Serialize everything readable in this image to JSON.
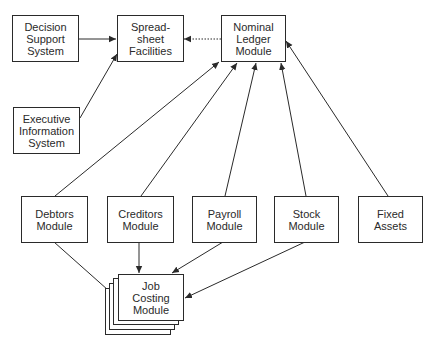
{
  "diagram": {
    "nodes": {
      "decision_support": {
        "label": "Decision\nSupport\nSystem"
      },
      "spreadsheet": {
        "label": "Spread-\nsheet\nFacilities"
      },
      "nominal_ledger": {
        "label": "Nominal\nLedger\nModule"
      },
      "executive_info": {
        "label": "Executive\nInformation\nSystem"
      },
      "debtors": {
        "label": "Debtors\nModule"
      },
      "creditors": {
        "label": "Creditors\nModule"
      },
      "payroll": {
        "label": "Payroll\nModule"
      },
      "stock": {
        "label": "Stock\nModule"
      },
      "fixed_assets": {
        "label": "Fixed\nAssets"
      },
      "job_costing": {
        "label": "Job\nCosting\nModule"
      }
    },
    "edges": [
      {
        "from": "decision_support",
        "to": "spreadsheet",
        "style": "solid"
      },
      {
        "from": "executive_info",
        "to": "spreadsheet",
        "style": "solid"
      },
      {
        "from": "nominal_ledger",
        "to": "spreadsheet",
        "style": "dotted"
      },
      {
        "from": "debtors",
        "to": "nominal_ledger",
        "style": "solid"
      },
      {
        "from": "creditors",
        "to": "nominal_ledger",
        "style": "solid"
      },
      {
        "from": "payroll",
        "to": "nominal_ledger",
        "style": "solid"
      },
      {
        "from": "stock",
        "to": "nominal_ledger",
        "style": "solid"
      },
      {
        "from": "fixed_assets",
        "to": "nominal_ledger",
        "style": "solid"
      },
      {
        "from": "debtors",
        "to": "job_costing",
        "style": "solid"
      },
      {
        "from": "creditors",
        "to": "job_costing",
        "style": "solid"
      },
      {
        "from": "payroll",
        "to": "job_costing",
        "style": "solid"
      },
      {
        "from": "stock",
        "to": "job_costing",
        "style": "solid"
      }
    ],
    "colors": {
      "line": "#2a2a2a",
      "background": "#ffffff"
    }
  }
}
